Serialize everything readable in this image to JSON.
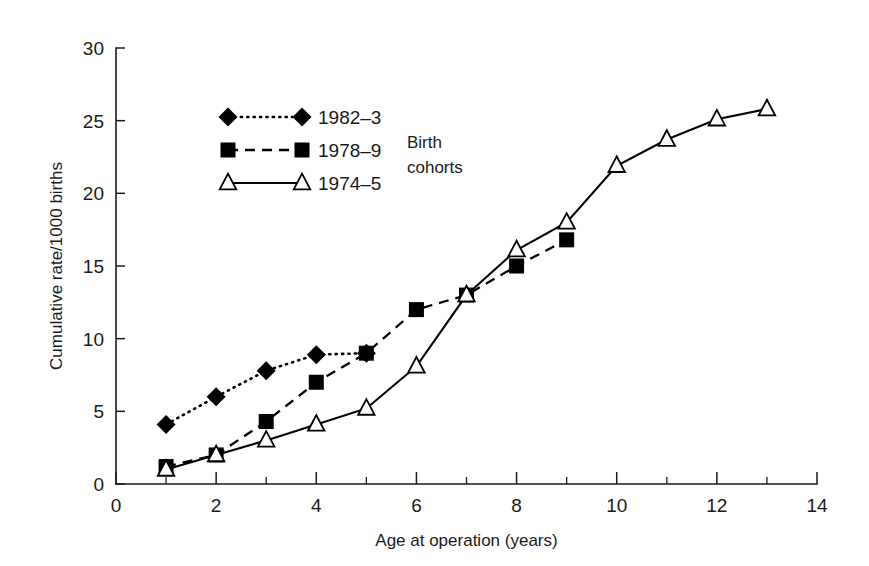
{
  "chart_data": {
    "type": "line",
    "title": "",
    "subtitle": "",
    "xlabel": "Age at operation (years)",
    "ylabel": "Cumulative rate/1000 births",
    "xlim": [
      0,
      14
    ],
    "ylim": [
      0,
      30
    ],
    "xticks": [
      0,
      2,
      4,
      6,
      8,
      10,
      12,
      14
    ],
    "xtick_labels": [
      "0",
      "2",
      "4",
      "6",
      "8",
      "10",
      "12",
      "14"
    ],
    "xticks_minor": [
      1,
      3,
      5,
      7,
      9,
      11,
      13
    ],
    "yticks": [
      0,
      5,
      10,
      15,
      20,
      25,
      30
    ],
    "ytick_labels": [
      "0",
      "5",
      "10",
      "15",
      "20",
      "25",
      "30"
    ],
    "grid": false,
    "legend_position": "upper-left-inside",
    "legend_title": "Birth cohorts",
    "series": [
      {
        "name": "1982–3",
        "marker": "filled-diamond",
        "linestyle": "dotted",
        "color": "#000000",
        "x": [
          1,
          2,
          3,
          4,
          5
        ],
        "values": [
          4.1,
          6.0,
          7.8,
          8.9,
          9.0
        ]
      },
      {
        "name": "1978–9",
        "marker": "filled-square",
        "linestyle": "dashed",
        "color": "#000000",
        "x": [
          1,
          2,
          3,
          4,
          5,
          6,
          7,
          8,
          9
        ],
        "values": [
          1.2,
          2.0,
          4.3,
          7.0,
          9.0,
          12.0,
          13.0,
          15.0,
          16.8
        ]
      },
      {
        "name": "1974–5",
        "marker": "open-triangle",
        "linestyle": "solid",
        "color": "#000000",
        "x": [
          1,
          2,
          3,
          4,
          5,
          6,
          7,
          8,
          9,
          10,
          11,
          12,
          13
        ],
        "values": [
          1.0,
          2.0,
          3.0,
          4.1,
          5.2,
          8.1,
          13.0,
          16.1,
          18.0,
          21.9,
          23.7,
          25.1,
          25.8
        ]
      }
    ]
  },
  "legend": {
    "title_line1": "Birth",
    "title_line2": "cohorts",
    "entries": [
      {
        "label": "1982–3"
      },
      {
        "label": "1978–9"
      },
      {
        "label": "1974–5"
      }
    ]
  },
  "axes": {
    "x_title": "Age at operation (years)",
    "y_title": "Cumulative rate/1000 births"
  }
}
